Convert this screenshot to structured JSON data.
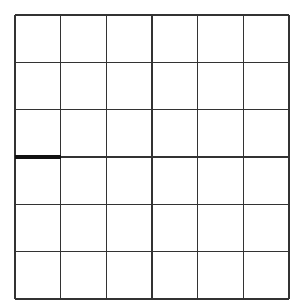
{
  "board": {
    "cols": 6,
    "rows": 6,
    "line_color": "#333333",
    "background": "#ffffff",
    "drawn_segments": [
      {
        "orientation": "horizontal",
        "row_line": 3,
        "col": 0,
        "color": "#111111",
        "thickness": 4
      }
    ]
  }
}
